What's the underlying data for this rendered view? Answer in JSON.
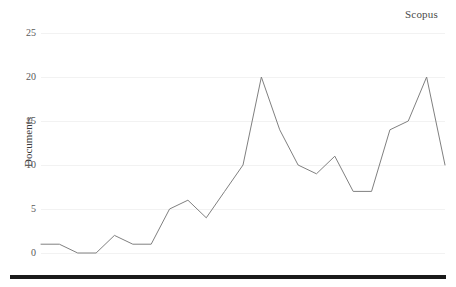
{
  "chart_data": {
    "type": "line",
    "title": "Scopus",
    "xlabel": "",
    "ylabel": "Documents",
    "x": [
      1994,
      1995,
      1996,
      1997,
      1998,
      1999,
      2000,
      2001,
      2002,
      2003,
      2004,
      2005,
      2006,
      2007,
      2008,
      2009,
      2010,
      2011,
      2012,
      2013,
      2014,
      2015,
      2016
    ],
    "values": [
      1,
      1,
      0,
      0,
      2,
      1,
      1,
      5,
      6,
      4,
      7,
      10,
      20,
      14,
      10,
      9,
      11,
      7,
      7,
      14,
      15,
      20,
      10
    ],
    "series": [
      {
        "name": "Scopus",
        "values": [
          1,
          1,
          0,
          0,
          2,
          1,
          1,
          5,
          6,
          4,
          7,
          10,
          20,
          14,
          10,
          9,
          11,
          7,
          7,
          14,
          15,
          20,
          10
        ]
      }
    ],
    "xlim": [
      1994,
      2016
    ],
    "ylim": [
      0,
      25
    ],
    "y_ticks": [
      0,
      5,
      10,
      15,
      20,
      25
    ],
    "y_tick_labels": [
      "0",
      "5",
      "10",
      "15",
      "20",
      "25"
    ],
    "x_ticks": [
      1994,
      1996,
      1998,
      2000,
      2002,
      2004,
      2006,
      2008,
      2010,
      2012,
      2014,
      2016
    ],
    "x_tick_labels": [
      "1994",
      "1996",
      "1998",
      "2000",
      "2002",
      "2004",
      "2006",
      "2008",
      "2010",
      "2012",
      "2014",
      "2016"
    ],
    "grid": true,
    "grid_axis": "y",
    "legend": "none",
    "line_color": "#808080",
    "grid_color": "#f2f2f2",
    "text_color": "#595959",
    "rule_color": "#1a1a1a"
  }
}
